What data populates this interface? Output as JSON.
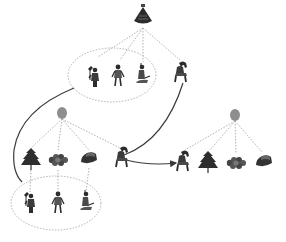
{
  "diagram": {
    "type": "hierarchical concept diagram with icon nodes",
    "colors": {
      "background": "#ffffff",
      "dotted_line": "#a8a8a8",
      "solid_line": "#3a3a3a",
      "grey_node": "#8e8e8e",
      "icon_dark": "#2c2c2c"
    },
    "root": {
      "icon": "lamp-icon",
      "x": 143,
      "y": 18
    },
    "top_group": {
      "ellipse": {
        "cx": 112,
        "cy": 75,
        "rx": 44,
        "ry": 27
      },
      "members": [
        {
          "icon": "person-with-axe-icon",
          "x": 94,
          "y": 78
        },
        {
          "icon": "person-standing-icon",
          "x": 118,
          "y": 76
        },
        {
          "icon": "person-kneeling-icon",
          "x": 142,
          "y": 76
        }
      ]
    },
    "top_outlier": {
      "icon": "person-crouching-icon",
      "x": 181,
      "y": 73
    },
    "left_cluster": {
      "node": {
        "cx": 62,
        "cy": 113
      },
      "children": [
        {
          "icon": "tree-icon",
          "x": 31,
          "y": 159
        },
        {
          "icon": "cloud-shape-icon",
          "x": 58,
          "y": 160
        },
        {
          "icon": "hat-icon",
          "x": 89,
          "y": 158
        }
      ],
      "outlier": {
        "icon": "person-crouching-icon",
        "x": 122,
        "y": 158
      }
    },
    "right_cluster": {
      "node": {
        "cx": 235,
        "cy": 115
      },
      "children": [
        {
          "icon": "person-crouching-icon",
          "x": 183,
          "y": 162
        },
        {
          "icon": "tree-icon",
          "x": 208,
          "y": 162
        },
        {
          "icon": "cloud-shape-icon",
          "x": 236,
          "y": 163
        },
        {
          "icon": "hat-icon",
          "x": 264,
          "y": 161
        }
      ]
    },
    "bottom_group": {
      "ellipse": {
        "cx": 56,
        "cy": 203,
        "rx": 45,
        "ry": 27
      },
      "members": [
        {
          "icon": "person-with-axe-icon",
          "x": 30,
          "y": 204
        },
        {
          "icon": "person-standing-icon",
          "x": 58,
          "y": 203
        },
        {
          "icon": "person-kneeling-icon",
          "x": 86,
          "y": 203
        }
      ]
    }
  }
}
